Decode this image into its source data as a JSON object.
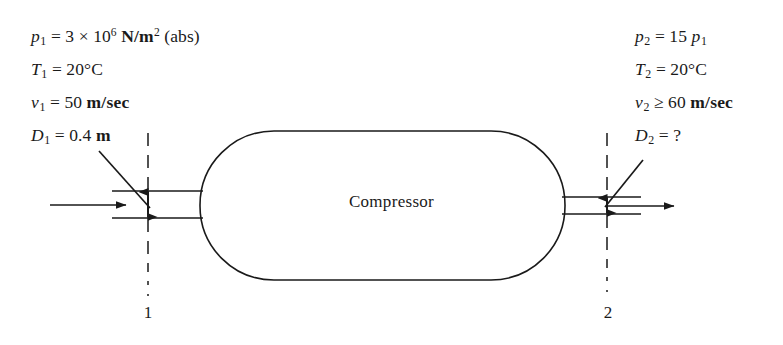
{
  "figure": {
    "vessel_label": "Compressor",
    "line_color": "#1a1a1a",
    "background_color": "#ffffff"
  },
  "inlet": {
    "section_number": "1",
    "conditions": [
      {
        "symbol": "p",
        "subscript": "1",
        "relation": "=",
        "value": "3 × 10",
        "exponent": "6",
        "unit": "N/m",
        "unit_exponent": "2",
        "qualifier": "(abs)"
      },
      {
        "symbol": "T",
        "subscript": "1",
        "relation": "=",
        "value": "20",
        "unit": "°C"
      },
      {
        "symbol": "v",
        "subscript": "1",
        "relation": "=",
        "value": "50",
        "unit": "m/sec"
      },
      {
        "symbol": "D",
        "subscript": "1",
        "relation": "=",
        "value": "0.4",
        "unit": "m"
      }
    ]
  },
  "outlet": {
    "section_number": "2",
    "conditions": [
      {
        "symbol": "p",
        "subscript": "2",
        "relation": "=",
        "value": "15",
        "ref_symbol": "p",
        "ref_subscript": "1"
      },
      {
        "symbol": "T",
        "subscript": "2",
        "relation": "=",
        "value": "20",
        "unit": "°C"
      },
      {
        "symbol": "v",
        "subscript": "2",
        "relation": "≥",
        "value": "60",
        "unit": "m/sec"
      },
      {
        "symbol": "D",
        "subscript": "2",
        "relation": "=",
        "value": "?"
      }
    ]
  }
}
